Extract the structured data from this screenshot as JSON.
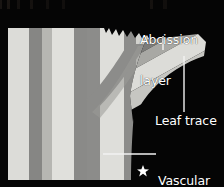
{
  "figure": {
    "background_color": "#050505",
    "width": 224,
    "height": 187
  },
  "labels": {
    "abcission_layer": "Abcission\nlayer",
    "abcission_layer_line1": "Abcission",
    "abcission_layer_line2": "layer",
    "leaf_trace": "Leaf trace",
    "vascular_tissue": "Vascular\ntissue",
    "vascular_tissue_line1": "Vascular",
    "vascular_tissue_line2": "tissue"
  },
  "markers": {
    "star_symbol": "★"
  },
  "colors": {
    "background": "#050505",
    "tissue_light": "#d6d6d2",
    "tissue_light_alt": "#e2e2de",
    "tissue_mid": "#bdbdb9",
    "tissue_dark_stripe": "#858583",
    "vascular_bundle": "#8c8c8a",
    "leaf_trace_core": "#7e7e7c",
    "leaf_trace_edge": "#c9c9c5",
    "label_text": "#ffffff",
    "leader_line": "#f2f2f2"
  },
  "structures": {
    "stripes": [
      {
        "name": "stripe-1-light",
        "x": 8,
        "width": 20,
        "fill": "#dcdcd8"
      },
      {
        "name": "stripe-2-dark",
        "x": 28,
        "width": 14,
        "fill": "#868684"
      },
      {
        "name": "stripe-3-mid",
        "x": 42,
        "width": 10,
        "fill": "#b4b4b0"
      },
      {
        "name": "stripe-4-light",
        "x": 52,
        "width": 22,
        "fill": "#e0e0dc"
      },
      {
        "name": "stripe-5-dark",
        "x": 74,
        "width": 14,
        "fill": "#8a8a88"
      },
      {
        "name": "stripe-6-core",
        "x": 88,
        "width": 12,
        "fill": "#8c8c8a"
      },
      {
        "name": "stripe-7-light",
        "x": 100,
        "width": 24,
        "fill": "#dededa"
      },
      {
        "name": "stripe-8-dark",
        "x": 124,
        "width": 12,
        "fill": "#8c8c8a"
      },
      {
        "name": "stripe-9-light",
        "x": 136,
        "width": 12,
        "fill": "#d2d2ce"
      }
    ],
    "tissue_block": {
      "top": 28,
      "bottom": 180,
      "left": 8,
      "right": 148
    },
    "branch_junction_y": 96,
    "jagged_edge_span": {
      "from_x": 104,
      "to_x": 168
    }
  },
  "leaders": {
    "abcission_layer": {
      "x": 163,
      "y_top": 36,
      "y_bottom": 50
    },
    "leaf_trace": {
      "x": 184,
      "y_top": 56,
      "y_bottom": 112
    },
    "vascular_tissue": {
      "y": 154,
      "x_left": 103,
      "x_right": 155
    }
  }
}
